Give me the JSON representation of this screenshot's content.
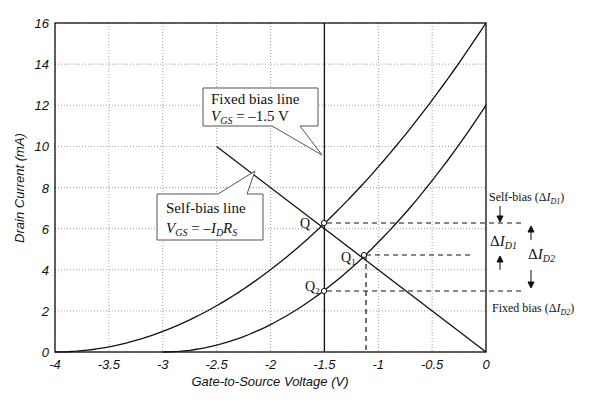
{
  "chart_data": {
    "type": "line",
    "title": "",
    "xlabel": "Gate-to-Source Voltage (V)",
    "ylabel": "Drain Current (mA)",
    "xlim": [
      -4,
      0
    ],
    "ylim": [
      0,
      16
    ],
    "xticks": [
      "-4",
      "-3.5",
      "-3",
      "-2.5",
      "-2",
      "-1.5",
      "-1",
      "-0.5",
      "0"
    ],
    "yticks": [
      "0",
      "2",
      "4",
      "6",
      "8",
      "10",
      "12",
      "14",
      "16"
    ],
    "grid": true,
    "series": [
      {
        "name": "Transfer curve 1 (IDSS=16 mA, VP=-4 V)",
        "idss": 16,
        "vp": -4,
        "x": [
          -4,
          -3.5,
          -3,
          -2.5,
          -2,
          -1.5,
          -1,
          -0.5,
          0
        ],
        "y": [
          0,
          0.25,
          1,
          2.25,
          4,
          6.25,
          9,
          12.25,
          16
        ]
      },
      {
        "name": "Transfer curve 2 (IDSS=12 mA, VP=-3 V)",
        "idss": 12,
        "vp": -3,
        "x": [
          -3,
          -2.5,
          -2,
          -1.5,
          -1,
          -0.5,
          0
        ],
        "y": [
          0,
          0.33,
          1.33,
          3,
          5.33,
          8.33,
          12
        ]
      },
      {
        "name": "Self-bias line",
        "x": [
          -2.5,
          0
        ],
        "y": [
          10,
          0
        ]
      },
      {
        "name": "Fixed bias line",
        "x": [
          -1.5,
          -1.5
        ],
        "y": [
          0,
          16
        ]
      }
    ],
    "points": [
      {
        "label": "Q",
        "x": -1.5,
        "y": 6.25
      },
      {
        "label": "Q1",
        "x": -1.13,
        "y": 4.7
      },
      {
        "label": "Q2",
        "x": -1.5,
        "y": 3.0
      }
    ],
    "annotations": [
      {
        "text": "Fixed bias line",
        "sub": "V_GS = -1.5 V"
      },
      {
        "text": "Self-bias line",
        "sub": "V_GS = -I_D R_S"
      },
      {
        "text": "Self-bias (ΔI_D1)"
      },
      {
        "text": "ΔI_D1"
      },
      {
        "text": "ΔI_D2"
      },
      {
        "text": "Fixed bias (ΔI_D2)"
      }
    ]
  },
  "labels": {
    "xlabel": "Gate-to-Source Voltage (V)",
    "ylabel": "Drain Current (mA)",
    "fixed_title": "Fixed bias line",
    "fixed_eq_v": "V",
    "fixed_eq_sub": "GS",
    "fixed_eq_rest": " = –1.5 V",
    "self_title": "Self-bias line",
    "self_eq_v": "V",
    "self_eq_sub": "GS",
    "self_eq_rest": " = –",
    "self_eq_i": "I",
    "self_eq_isub": "D",
    "self_eq_r": "R",
    "self_eq_rsub": "S",
    "q": "Q",
    "q1": "Q",
    "q1_sub": "1",
    "q2": "Q",
    "q2_sub": "2",
    "selfbias_label": "Self-bias (Δ",
    "fixedbias_label": "Fixed bias (Δ",
    "delta_i": "ΔI",
    "d1": "D1",
    "d2": "D2",
    "close_paren": ")"
  }
}
